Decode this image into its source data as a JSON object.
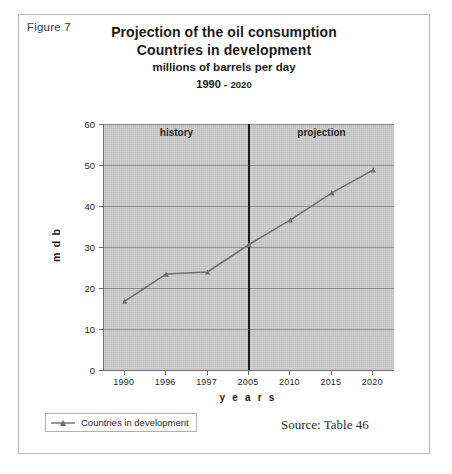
{
  "figure": {
    "label": "Figure 7",
    "source_note": "Source: Table 46"
  },
  "title": {
    "line1": "Projection of the oil consumption",
    "line2": "Countries in development",
    "line3": "millions of barrels per day",
    "line4_start": "1990 - ",
    "line4_end": "2020"
  },
  "annotations": {
    "history": "history",
    "projection": "projection",
    "divider_category": "2005"
  },
  "legend": {
    "entries": [
      {
        "label": "Countries in development",
        "color": "#6b6b6b"
      }
    ]
  },
  "chart_data": {
    "type": "line",
    "title": "Projection of the oil consumption Countries in development",
    "subtitle": "millions of barrels per day 1990 - 2020",
    "xlabel": "y e a r s",
    "ylabel": "m d b",
    "categories": [
      "1990",
      "1996",
      "1997",
      "2005",
      "2010",
      "2015",
      "2020"
    ],
    "values": [
      16.8,
      23.4,
      23.9,
      30.6,
      36.6,
      43.2,
      48.8
    ],
    "series": [
      {
        "name": "Countries in development",
        "values": [
          16.8,
          23.4,
          23.9,
          30.6,
          36.6,
          43.2,
          48.8
        ],
        "color": "#6b6b6b",
        "marker": "triangle"
      }
    ],
    "ylim": [
      0,
      60
    ],
    "yticks": [
      0,
      10,
      20,
      30,
      40,
      50,
      60
    ],
    "ytick_labels": [
      "0",
      "10",
      "20",
      "30",
      "40",
      "50",
      "60"
    ],
    "grid": true,
    "grid_axis": "y",
    "legend_position": "below-left",
    "plot_background": "#c9c9c9",
    "annotations": [
      {
        "text": "history",
        "region": "1990-2005"
      },
      {
        "text": "projection",
        "region": "2005-2020"
      },
      {
        "text": "vertical divider at 2005"
      }
    ]
  }
}
